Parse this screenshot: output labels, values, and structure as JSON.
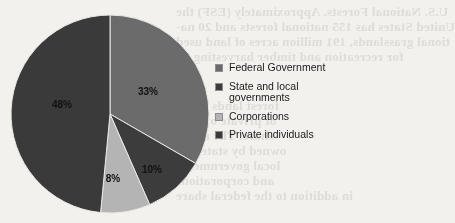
{
  "chart_data": {
    "type": "pie",
    "title": "",
    "subtitle": "",
    "xlabel": "",
    "ylabel": "",
    "legend_position": "right",
    "grid": false,
    "start_angle_deg": 0,
    "direction": "clockwise",
    "categories": [
      "Federal Government",
      "State and local governments",
      "Corporations",
      "Private individuals"
    ],
    "values": [
      33,
      10,
      8,
      48
    ],
    "value_unit": "%",
    "slices": [
      {
        "label": "Federal Government",
        "value": 33,
        "display": "33%",
        "color": "#6b6b6b",
        "label_x": 148,
        "label_y": 95
      },
      {
        "label": "State and local governments",
        "value": 10,
        "display": "10%",
        "color": "#3c3c3c",
        "label_x": 152,
        "label_y": 173
      },
      {
        "label": "Corporations",
        "value": 8,
        "display": "8%",
        "color": "#b4b4b4",
        "label_x": 113,
        "label_y": 182
      },
      {
        "label": "Private individuals",
        "value": 48,
        "display": "48%",
        "color": "#3a3a3a",
        "label_x": 62,
        "label_y": 108
      }
    ]
  },
  "legend": {
    "items": [
      {
        "label": "Federal Government",
        "color": "#6b6b6b",
        "lines": [
          "Federal Government"
        ]
      },
      {
        "label": "State and local governments",
        "color": "#3c3c3c",
        "lines": [
          "State and local",
          "governments"
        ]
      },
      {
        "label": "Corporations",
        "color": "#b4b4b4",
        "lines": [
          "Corporations"
        ]
      },
      {
        "label": "Private individuals",
        "color": "#3a3a3a",
        "lines": [
          "Private individuals"
        ]
      }
    ]
  },
  "background": {
    "page_color": "#f3f1ee",
    "bleed_text": [
      {
        "text": "U.S. National Forests. Approximately (ESF) the",
        "x": 176,
        "y": 4,
        "size": 13
      },
      {
        "text": "United States has 155 national forests and 20 na-",
        "x": 176,
        "y": 19,
        "size": 13
      },
      {
        "text": "tional grasslands, 191 million acres of land used",
        "x": 176,
        "y": 34,
        "size": 13
      },
      {
        "text": "for recreation and timber harvesting on",
        "x": 176,
        "y": 49,
        "size": 13
      },
      {
        "text": "forest lands in the",
        "x": 176,
        "y": 98,
        "size": 13
      },
      {
        "text": "of private owners",
        "x": 176,
        "y": 113,
        "size": 13
      },
      {
        "text": "share. The rest is",
        "x": 176,
        "y": 128,
        "size": 13
      },
      {
        "text": "owned by state and",
        "x": 176,
        "y": 143,
        "size": 13
      },
      {
        "text": "local governments",
        "x": 176,
        "y": 158,
        "size": 13
      },
      {
        "text": "and corporations",
        "x": 176,
        "y": 173,
        "size": 13
      },
      {
        "text": "in addition to the federal share",
        "x": 176,
        "y": 188,
        "size": 13
      }
    ]
  }
}
